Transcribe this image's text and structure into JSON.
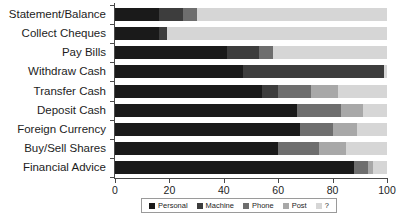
{
  "chart_data": {
    "type": "bar",
    "orientation": "horizontal",
    "stacked": true,
    "title": "",
    "xlabel": "",
    "ylabel": "",
    "xlim": [
      0,
      100
    ],
    "xticks": [
      0,
      20,
      40,
      60,
      80,
      100
    ],
    "grid": false,
    "legend_position": "bottom",
    "categories": [
      "Statement/Balance",
      "Collect Cheques",
      "Pay Bills",
      "Withdraw Cash",
      "Transfer Cash",
      "Deposit Cash",
      "Foreign Currency",
      "Buy/Sell Shares",
      "Financial Advice"
    ],
    "series": [
      {
        "name": "Personal",
        "color": "#1a1a1a",
        "values": [
          16,
          16,
          41,
          47,
          54,
          67,
          68,
          60,
          88
        ]
      },
      {
        "name": "Machine",
        "color": "#3d3d3d",
        "values": [
          9,
          3,
          12,
          52,
          6,
          0,
          0,
          0,
          0
        ]
      },
      {
        "name": "Phone",
        "color": "#6e6e6e",
        "values": [
          5,
          0,
          5,
          0,
          12,
          16,
          12,
          15,
          5
        ]
      },
      {
        "name": "Post",
        "color": "#a8a8a8",
        "values": [
          0,
          0,
          0,
          0,
          10,
          8,
          9,
          10,
          2
        ]
      },
      {
        "name": "?",
        "color": "#d6d6d6",
        "values": [
          70,
          81,
          42,
          1,
          18,
          9,
          11,
          15,
          5
        ]
      }
    ]
  },
  "legend": {
    "items": [
      {
        "label": "Personal",
        "color": "#1a1a1a"
      },
      {
        "label": "Machine",
        "color": "#3d3d3d"
      },
      {
        "label": "Phone",
        "color": "#6e6e6e"
      },
      {
        "label": "Post",
        "color": "#a8a8a8"
      },
      {
        "label": "?",
        "color": "#d6d6d6"
      }
    ]
  },
  "axis": {
    "tick_labels": [
      "0",
      "20",
      "40",
      "60",
      "80",
      "100"
    ]
  }
}
